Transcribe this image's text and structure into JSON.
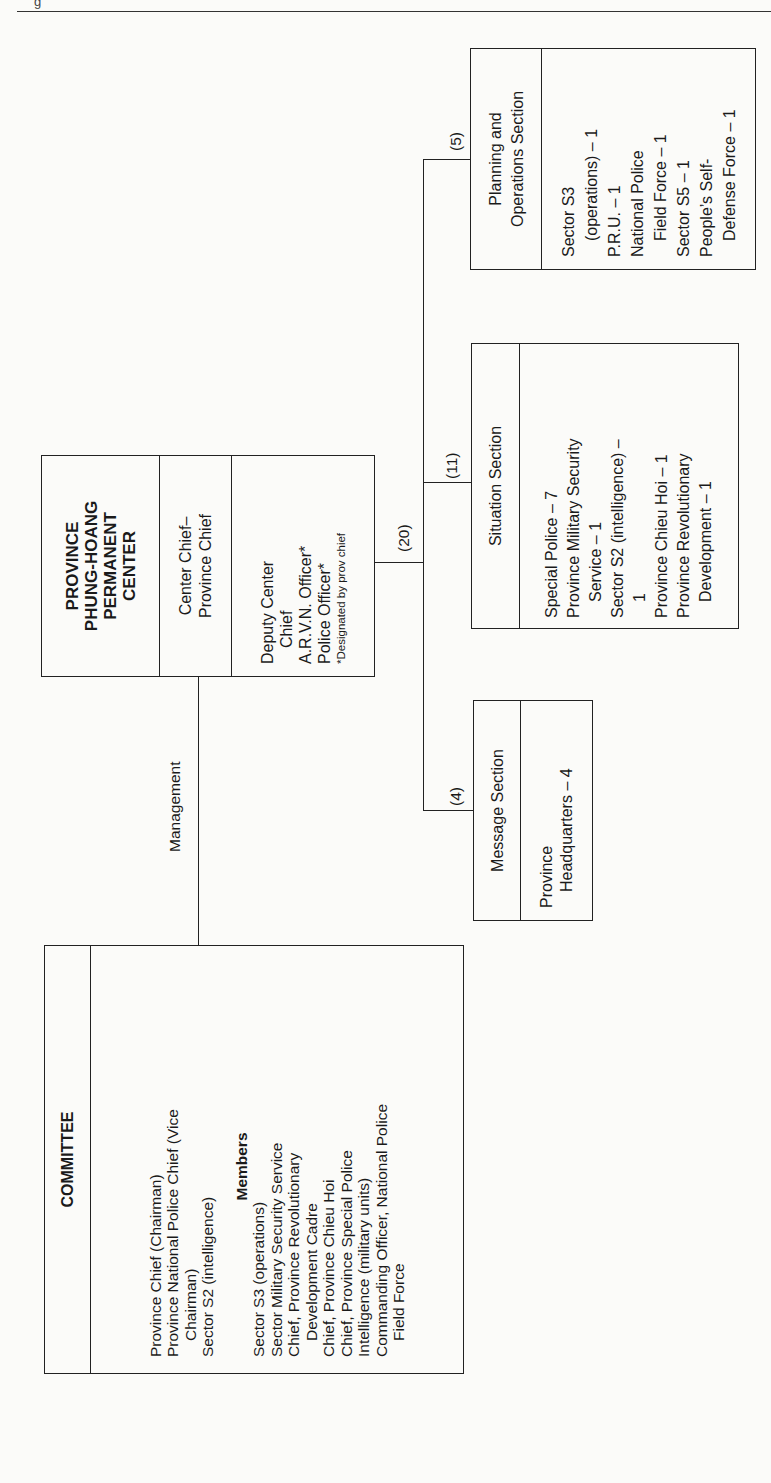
{
  "page": {
    "header_fragment": "g"
  },
  "center": {
    "title_lines": [
      "PROVINCE",
      "PHUNG-HOANG",
      "PERMANENT",
      "CENTER"
    ],
    "chief_lines": [
      "Center Chief–",
      "Province Chief"
    ],
    "deputy_lines": [
      {
        "text": "Deputy Center",
        "indent": false
      },
      {
        "text": "Chief",
        "indent": true
      },
      {
        "text": "A.R.V.N. Officer*",
        "indent": false
      },
      {
        "text": "Police Officer*",
        "indent": false
      }
    ],
    "footnote": "*Designated by prov chief",
    "staff_count": "(20)"
  },
  "management_label": "Management",
  "committee": {
    "title": "COMMITTEE",
    "leaders": [
      {
        "text": "Province Chief (Chairman)",
        "indent": false
      },
      {
        "text": "Province National Police Chief (Vice",
        "indent": false
      },
      {
        "text": "Chairman)",
        "indent": true
      },
      {
        "text": "Sector S2 (intelligence)",
        "indent": false
      }
    ],
    "members_heading": "Members",
    "members": [
      {
        "text": "Sector S3 (operations)",
        "indent": false
      },
      {
        "text": "Sector Military Security Service",
        "indent": false
      },
      {
        "text": "Chief, Province Revolutionary",
        "indent": false
      },
      {
        "text": "Development Cadre",
        "indent": true
      },
      {
        "text": "Chief, Province Chieu Hoi",
        "indent": false
      },
      {
        "text": "Chief, Province Special Police",
        "indent": false
      },
      {
        "text": "Intelligence (military units)",
        "indent": false
      },
      {
        "text": "Commanding Officer, National Police",
        "indent": false
      },
      {
        "text": "Field Force",
        "indent": true
      }
    ]
  },
  "sections": {
    "message": {
      "count": "(4)",
      "title_lines": [
        "Message Section"
      ],
      "staff": [
        {
          "text": "Province",
          "indent": false
        },
        {
          "text": "Headquarters – 4",
          "indent": true
        }
      ]
    },
    "situation": {
      "count": "(11)",
      "title_lines": [
        "Situation Section"
      ],
      "staff": [
        {
          "text": "Special Police – 7",
          "indent": false
        },
        {
          "text": "Province Military Security",
          "indent": false
        },
        {
          "text": "Service – 1",
          "indent": true
        },
        {
          "text": "Sector S2 (intelligence) –",
          "indent": false
        },
        {
          "text": "1",
          "indent": true
        },
        {
          "text": "Province Chieu Hoi – 1",
          "indent": false
        },
        {
          "text": "Province Revolutionary",
          "indent": false
        },
        {
          "text": "Development – 1",
          "indent": true
        }
      ]
    },
    "planning": {
      "count": "(5)",
      "title_lines": [
        "Planning and",
        "Operations Section"
      ],
      "staff": [
        {
          "text": "Sector S3",
          "indent": false
        },
        {
          "text": "(operations) – 1",
          "indent": true
        },
        {
          "text": "P.R.U. – 1",
          "indent": false
        },
        {
          "text": "National Police",
          "indent": false
        },
        {
          "text": "Field Force – 1",
          "indent": true
        },
        {
          "text": "Sector S5 – 1",
          "indent": false
        },
        {
          "text": "People’s Self-",
          "indent": false
        },
        {
          "text": "Defense Force – 1",
          "indent": true
        }
      ]
    }
  }
}
